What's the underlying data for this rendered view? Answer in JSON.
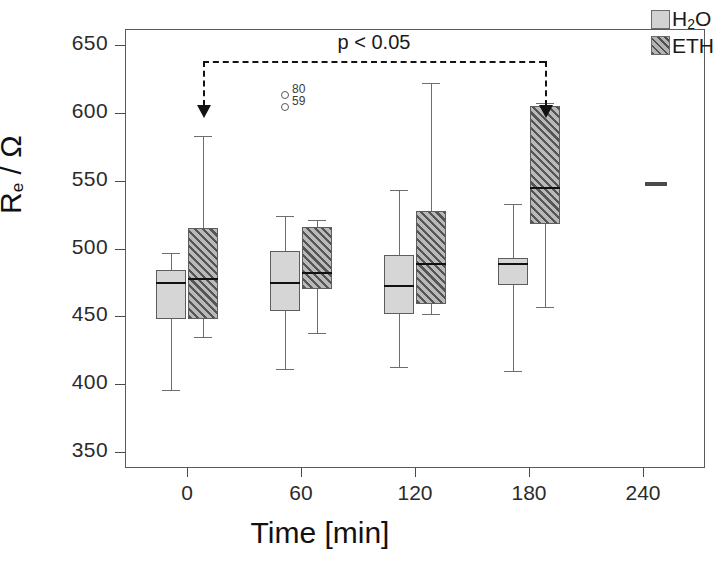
{
  "chart_data": {
    "type": "box",
    "title": "",
    "xlabel": "Time [min]",
    "ylabel": "R_e / Ω",
    "ylabel_parts": {
      "base": "R",
      "sub": "e",
      "unit": "/ Ω"
    },
    "xlim": [
      -30,
      270
    ],
    "ylim": [
      340,
      660
    ],
    "yticks": [
      350,
      400,
      450,
      500,
      550,
      600,
      650
    ],
    "xticks": [
      0,
      60,
      120,
      180,
      240
    ],
    "xtick_labels": [
      "0",
      "60",
      "120",
      "180",
      "240"
    ],
    "ytick_labels": [
      "350",
      "400",
      "450",
      "500",
      "550",
      "600",
      "650"
    ],
    "grid": false,
    "legend_position": "top-right",
    "series": [
      {
        "name": "H2O",
        "label": "H₂O",
        "fill": "#d6d6d6",
        "pattern": "solid"
      },
      {
        "name": "ETH",
        "label": "ETH",
        "fill": "#b9b9b9",
        "pattern": "diagonal-hatch"
      }
    ],
    "categories": [
      0,
      60,
      120,
      180,
      240
    ],
    "boxes": [
      {
        "time": 0,
        "series": "H2O",
        "whisker_low": 396,
        "q1": 448,
        "median": 475,
        "q3": 484,
        "whisker_high": 497
      },
      {
        "time": 0,
        "series": "ETH",
        "whisker_low": 435,
        "q1": 448,
        "median": 478,
        "q3": 515,
        "whisker_high": 583
      },
      {
        "time": 60,
        "series": "H2O",
        "whisker_low": 411,
        "q1": 454,
        "median": 475,
        "q3": 498,
        "whisker_high": 524
      },
      {
        "time": 60,
        "series": "ETH",
        "whisker_low": 438,
        "q1": 470,
        "median": 483,
        "q3": 516,
        "whisker_high": 521
      },
      {
        "time": 120,
        "series": "H2O",
        "whisker_low": 413,
        "q1": 452,
        "median": 473,
        "q3": 495,
        "whisker_high": 543
      },
      {
        "time": 120,
        "series": "ETH",
        "whisker_low": 452,
        "q1": 459,
        "median": 489,
        "q3": 528,
        "whisker_high": 622
      },
      {
        "time": 180,
        "series": "H2O",
        "whisker_low": 410,
        "q1": 473,
        "median": 489,
        "q3": 493,
        "whisker_high": 533
      },
      {
        "time": 180,
        "series": "ETH",
        "whisker_low": 457,
        "q1": 518,
        "median": 545,
        "q3": 605,
        "whisker_high": 607
      }
    ],
    "outliers": [
      {
        "time": 60,
        "series": "H2O",
        "value": 613,
        "label": "80"
      },
      {
        "time": 60,
        "series": "H2O",
        "value": 604,
        "label": "59"
      }
    ],
    "single_points": [
      {
        "time": 240,
        "value": 549,
        "label": ""
      }
    ],
    "annotations": [
      {
        "type": "significance-bracket",
        "text": "p < 0.05",
        "from_time": 0,
        "to_time": 180,
        "y": 638,
        "arrow_to_y": 598
      }
    ]
  },
  "legend": {
    "entries": [
      {
        "name": "h2o",
        "label_main": "H",
        "label_sub": "2",
        "label_tail": "O"
      },
      {
        "name": "eth",
        "label_main": "ETH",
        "label_sub": "",
        "label_tail": ""
      }
    ]
  }
}
